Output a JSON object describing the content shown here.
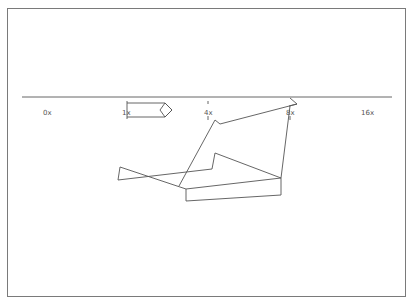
{
  "diagram": {
    "axis": {
      "labels": [
        "0x",
        "1x",
        "4x",
        "8x",
        "16x"
      ],
      "line_color": "#555555"
    },
    "stroke_color": "#555555",
    "background": "#ffffff",
    "frame_color": "#7a7a7a"
  }
}
